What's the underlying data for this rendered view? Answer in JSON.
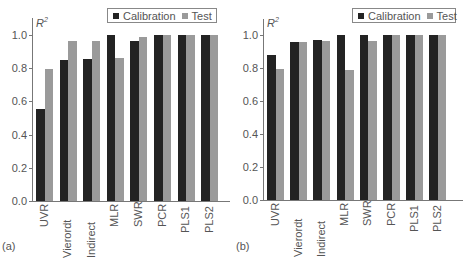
{
  "legend": {
    "calibration": "Calibration",
    "test": "Test"
  },
  "colors": {
    "calibration": "#232323",
    "test": "#9a9a9a"
  },
  "ylabel": "R",
  "ylabel_sup": "2",
  "yticks": [
    "0.0",
    "0.2",
    "0.4",
    "0.6",
    "0.8",
    "1.0"
  ],
  "panels": [
    {
      "tag": "(a)"
    },
    {
      "tag": "(b)"
    }
  ],
  "chart_data": [
    {
      "type": "bar",
      "title": "(a)",
      "xlabel": "",
      "ylabel": "R^2",
      "ylim": [
        0,
        1.1
      ],
      "yticks": [
        0.0,
        0.2,
        0.4,
        0.6,
        0.8,
        1.0
      ],
      "grid": false,
      "legend_position": "top-right",
      "categories": [
        "UVR",
        "Vierordt",
        "Indirect",
        "MLR",
        "SWR",
        "PCR",
        "PLS1",
        "PLS2"
      ],
      "series": [
        {
          "name": "Calibration",
          "values": [
            0.555,
            0.847,
            0.855,
            1.0,
            0.962,
            1.0,
            1.0,
            1.0
          ]
        },
        {
          "name": "Test",
          "values": [
            0.795,
            0.966,
            0.966,
            0.861,
            0.988,
            1.0,
            1.0,
            1.0
          ]
        }
      ]
    },
    {
      "type": "bar",
      "title": "(b)",
      "xlabel": "",
      "ylabel": "R^2",
      "ylim": [
        0,
        1.1
      ],
      "yticks": [
        0.0,
        0.2,
        0.4,
        0.6,
        0.8,
        1.0
      ],
      "grid": false,
      "legend_position": "top-right",
      "categories": [
        "UVR",
        "Vierordt",
        "Indirect",
        "MLR",
        "SWR",
        "PCR",
        "PLS1",
        "PLS2"
      ],
      "series": [
        {
          "name": "Calibration",
          "values": [
            0.881,
            0.96,
            0.97,
            1.0,
            0.998,
            1.0,
            1.0,
            1.0
          ]
        },
        {
          "name": "Test",
          "values": [
            0.796,
            0.96,
            0.964,
            0.786,
            0.962,
            1.0,
            1.0,
            1.0
          ]
        }
      ]
    }
  ]
}
